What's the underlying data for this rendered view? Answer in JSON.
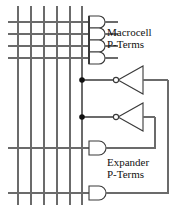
{
  "diagram": {
    "type": "logic-schematic",
    "colors": {
      "wire": "#6b6b6b",
      "gate_outline": "#3a3a3a",
      "junction_dot": "#111111",
      "text": "#111111",
      "background": "#ffffff"
    },
    "labels": {
      "macrocell": {
        "line1": "Macrocell",
        "line2": "P-Terms"
      },
      "expander": {
        "line1": "Expander",
        "line2": "P-Terms"
      }
    },
    "product_term_lines": {
      "count": 6,
      "orientation": "vertical",
      "x_positions": [
        18,
        31,
        44,
        57,
        70,
        82
      ],
      "y_top": 6,
      "y_bottom": 205
    },
    "macrocell_gates": {
      "count": 4,
      "type": "AND",
      "input_line_y": [
        22,
        34,
        46,
        58
      ],
      "x": 88,
      "output_x": 118
    },
    "expander_gates": {
      "count": 2,
      "type": "AND",
      "input_line_y": [
        148,
        193
      ],
      "x": 88,
      "output_x": 118
    },
    "inverters": {
      "count": 2,
      "type": "NOT",
      "orientation": "right-to-left",
      "bubble_side": "left",
      "input_line_y": [
        80,
        117
      ]
    },
    "junction_dots": [
      {
        "x": 82,
        "y": 80
      },
      {
        "x": 82,
        "y": 117
      }
    ],
    "feedback_paths": [
      {
        "from": "inverter-1-output",
        "to": "expander-gate-2-input",
        "route": "outer"
      },
      {
        "from": "inverter-2-output",
        "to": "expander-gate-1-input",
        "route": "inner"
      }
    ]
  }
}
